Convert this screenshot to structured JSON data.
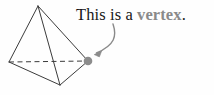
{
  "figure": {
    "background_color": "#fefefe",
    "caption": {
      "full_text": "This is a vertex.",
      "lead_text": "This is a ",
      "highlight_term": "vertex",
      "terminator": ".",
      "lead_color": "#171717",
      "highlight_color": "#8a8a8a",
      "font_style": "serif",
      "highlight_weight": "bold"
    },
    "shape": {
      "name": "tetrahedron",
      "edge_color": "#3b3b3b",
      "edge_width": 1,
      "hidden_edge_style": "dashed",
      "vertices": [
        {
          "id": "apex",
          "label": "apex",
          "x": 38,
          "y": 6
        },
        {
          "id": "left",
          "label": "left-base",
          "x": 9,
          "y": 62
        },
        {
          "id": "bottom",
          "label": "front-base",
          "x": 60,
          "y": 85
        },
        {
          "id": "right",
          "label": "highlighted-vertex",
          "x": 88,
          "y": 61
        }
      ],
      "solid_edges": [
        [
          "apex",
          "left"
        ],
        [
          "apex",
          "bottom"
        ],
        [
          "apex",
          "right"
        ],
        [
          "left",
          "bottom"
        ],
        [
          "bottom",
          "right"
        ]
      ],
      "dashed_edges": [
        [
          "left",
          "right"
        ]
      ]
    },
    "marker": {
      "name": "vertex-dot",
      "x": 88,
      "y": 61,
      "radius": 4.3,
      "color": "#8c8c8c"
    },
    "arrow": {
      "name": "annotation-arrow",
      "color": "#8a8a8a",
      "width": 1.4,
      "start_x": 113,
      "start_y": 24,
      "end_x": 95,
      "end_y": 54,
      "control_x": 116,
      "control_y": 46,
      "head_size": 5
    }
  }
}
